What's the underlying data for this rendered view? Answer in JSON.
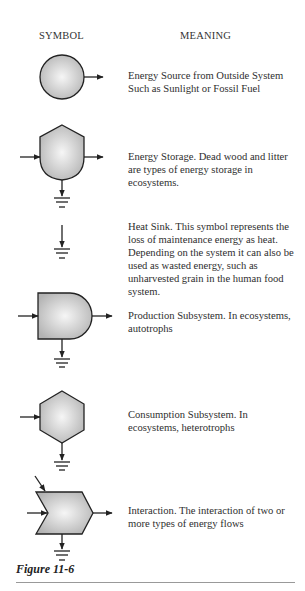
{
  "headers": {
    "symbol": "SYMBOL",
    "meaning": "MEANING"
  },
  "legend": [
    {
      "symbol": "energy-source-circle",
      "meaning": "Energy Source from Outside System Such as Sunlight or Fossil Fuel"
    },
    {
      "symbol": "energy-storage-tank",
      "meaning": "Energy Storage.  Dead wood and litter are types of energy storage in ecosystems."
    },
    {
      "symbol": "heat-sink",
      "meaning": "Heat Sink.  This symbol represents the loss of maintenance energy as heat.  Depending on the system it can also be used as wasted energy, such as unharvested grain in the human food system."
    },
    {
      "symbol": "production-subsystem-bullet",
      "meaning": "Production Subsystem.  In ecosystems, autotrophs"
    },
    {
      "symbol": "consumption-subsystem-hexagon",
      "meaning": "Consumption Subsystem.  In ecosystems, heterotrophs"
    },
    {
      "symbol": "interaction-chevron",
      "meaning": "Interaction.  The interaction of two or more types of energy flows"
    }
  ],
  "figure_label": "Figure 11-6",
  "colors": {
    "stroke": "#222222",
    "fill_light": "#f4f4f4",
    "fill_dark": "#b5b5b5"
  }
}
